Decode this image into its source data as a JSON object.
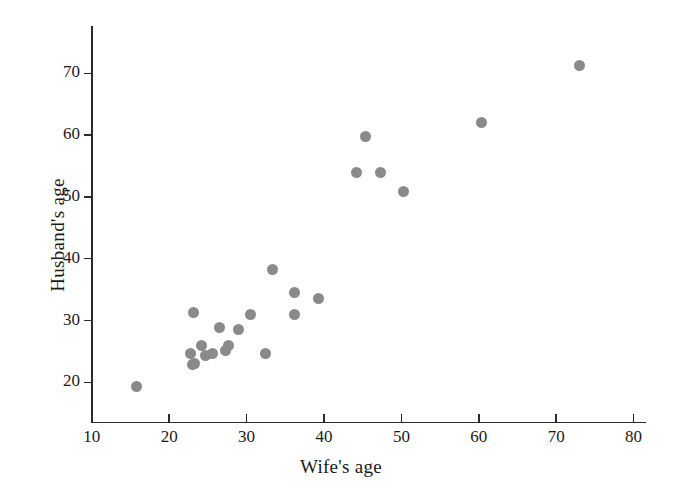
{
  "chart_data": {
    "type": "scatter",
    "title": "",
    "xlabel": "Wife's age",
    "ylabel": "Husband's age",
    "xlim": [
      10,
      82
    ],
    "ylim": [
      16,
      76
    ],
    "xticks": [
      10,
      20,
      30,
      40,
      50,
      60,
      70,
      80
    ],
    "yticks": [
      20,
      30,
      40,
      50,
      60,
      70
    ],
    "xtick_labels": [
      "10",
      "20",
      "30",
      "40",
      "50",
      "60",
      "70",
      "80"
    ],
    "ytick_labels": [
      "20",
      "30",
      "40",
      "50",
      "60",
      "70"
    ],
    "grid": false,
    "legend": null,
    "marker": {
      "shape": "circle",
      "color": "#8a8a8a",
      "size": 11
    },
    "series": [
      {
        "name": "couples",
        "x": [
          15.8,
          22.7,
          23.0,
          23.2,
          23.3,
          24.2,
          24.7,
          25.6,
          26.5,
          27.3,
          27.6,
          28.9,
          30.5,
          32.5,
          33.4,
          36.2,
          36.2,
          39.3,
          44.2,
          45.3,
          47.3,
          50.3,
          60.3,
          73.0
        ],
        "y": [
          19.4,
          24.7,
          22.8,
          31.3,
          23.0,
          25.9,
          24.4,
          24.7,
          28.8,
          25.2,
          26.0,
          28.6,
          31.0,
          24.7,
          38.2,
          34.6,
          30.9,
          33.6,
          54.0,
          59.8,
          54.0,
          50.8,
          62.0,
          71.2
        ]
      }
    ]
  },
  "axes": {
    "x_title": "Wife's age",
    "y_title": "Husband's age"
  }
}
